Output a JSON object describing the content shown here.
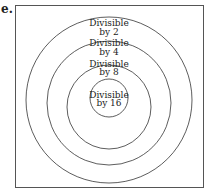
{
  "part_label": "e.",
  "diagram": {
    "type": "nested-circles",
    "rings": [
      {
        "line1": "Divisible",
        "line2": "by 2"
      },
      {
        "line1": "Divisible",
        "line2": "by 4"
      },
      {
        "line1": "Divisible",
        "line2": "by 8"
      },
      {
        "line1": "Divisible",
        "line2": "by 16"
      }
    ]
  }
}
